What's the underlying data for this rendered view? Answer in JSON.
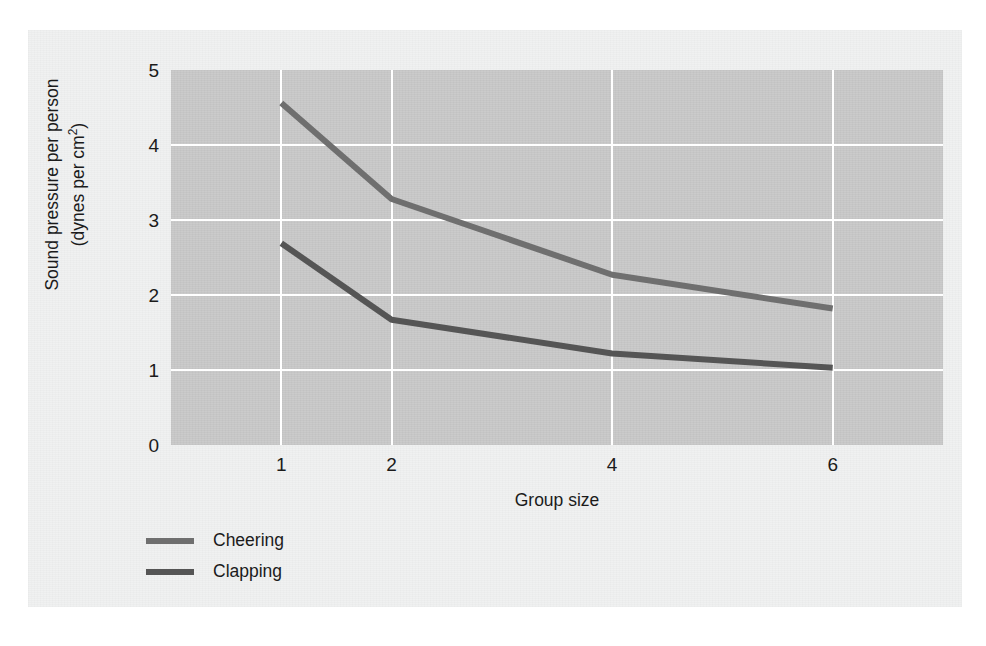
{
  "chart_data": {
    "type": "line",
    "title": "",
    "xlabel": "Group size",
    "ylabel_line1": "Sound pressure per person",
    "ylabel_line2": "(dynes per cm²)",
    "x": [
      1,
      2,
      4,
      6
    ],
    "xticklabels": [
      "1",
      "2",
      "4",
      "6"
    ],
    "yticklabels": [
      "5",
      "4",
      "3",
      "2",
      "1",
      "0"
    ],
    "yticks": [
      5,
      4,
      3,
      2,
      1,
      0
    ],
    "xlim": [
      0,
      7
    ],
    "ylim": [
      0,
      5
    ],
    "grid": true,
    "legend_position": "below-left",
    "series": [
      {
        "name": "Cheering",
        "values": [
          4.56,
          3.28,
          2.27,
          1.82
        ],
        "color": "#6f6f6f"
      },
      {
        "name": "Clapping",
        "values": [
          2.69,
          1.67,
          1.22,
          1.03
        ],
        "color": "#555555"
      }
    ]
  },
  "colors": {
    "plot_background": "#c9c9c9",
    "card_background": "#f0f1f1",
    "gridline": "#ffffff",
    "text": "#1b1b1b",
    "cheering": "#6f6f6f",
    "clapping": "#555555"
  }
}
